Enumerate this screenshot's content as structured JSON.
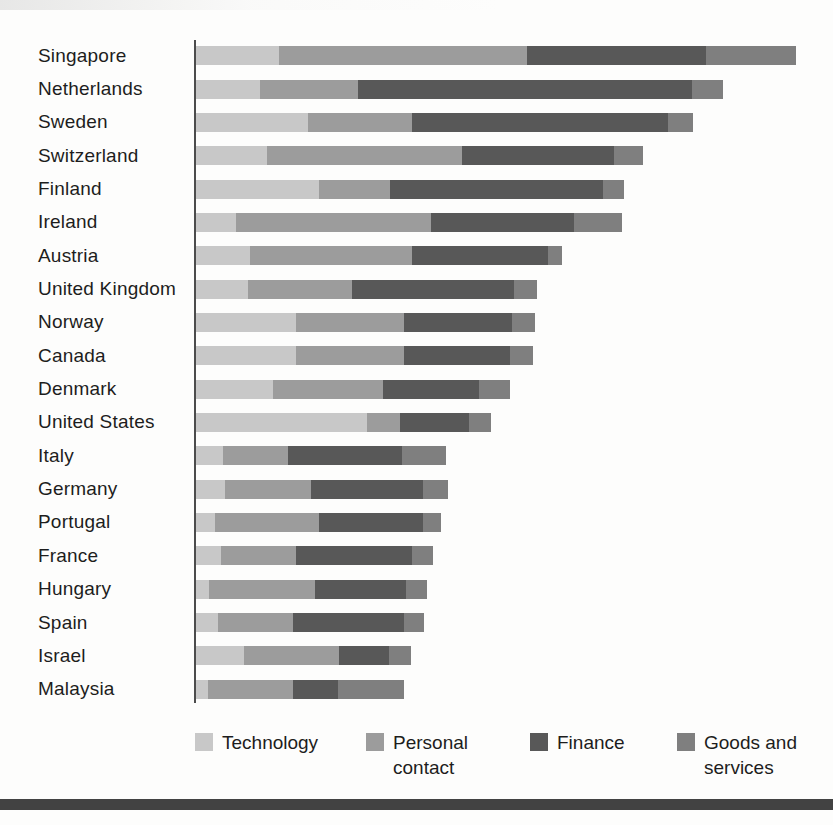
{
  "chart_data": {
    "type": "bar",
    "orientation": "horizontal",
    "stacked": true,
    "title": "",
    "xlabel": "",
    "ylabel": "",
    "axis_note": "no visible axis scale, ticks or gridlines; segment sizes estimated in pixels from the rendered bars",
    "units": "pixels (bar segment widths, no numeric axis shown)",
    "legend_position": "bottom",
    "categories": [
      "Singapore",
      "Netherlands",
      "Sweden",
      "Switzerland",
      "Finland",
      "Ireland",
      "Austria",
      "United Kingdom",
      "Norway",
      "Canada",
      "Denmark",
      "United States",
      "Italy",
      "Germany",
      "Portugal",
      "France",
      "Hungary",
      "Spain",
      "Israel",
      "Malaysia"
    ],
    "series": [
      {
        "name": "Technology",
        "color": "#c8c8c8",
        "values_px": [
          83,
          64,
          112,
          71,
          123,
          40,
          54,
          52,
          100,
          100,
          77,
          171,
          27,
          29,
          19,
          25,
          13,
          22,
          48,
          12
        ]
      },
      {
        "name": "Personal contact",
        "color": "#9c9c9c",
        "values_px": [
          248,
          98,
          104,
          195,
          71,
          195,
          162,
          104,
          108,
          108,
          110,
          33,
          65,
          86,
          104,
          75,
          106,
          75,
          95,
          85
        ]
      },
      {
        "name": "Finance",
        "color": "#585858",
        "values_px": [
          179,
          334,
          256,
          152,
          213,
          143,
          136,
          162,
          108,
          106,
          96,
          69,
          114,
          112,
          104,
          116,
          91,
          111,
          50,
          45
        ]
      },
      {
        "name": "Goods and services",
        "color": "#7f7f7f",
        "values_px": [
          90,
          31,
          25,
          29,
          21,
          48,
          14,
          23,
          23,
          23,
          31,
          22,
          44,
          25,
          18,
          21,
          21,
          20,
          22,
          66
        ]
      }
    ]
  },
  "legend": {
    "items": [
      {
        "label": "Technology",
        "color": "#c8c8c8",
        "x": 195
      },
      {
        "label": "Personal\ncontact",
        "color": "#9c9c9c",
        "x": 366
      },
      {
        "label": "Finance",
        "color": "#585858",
        "x": 530
      },
      {
        "label": "Goods and\nservices",
        "color": "#7f7f7f",
        "x": 677
      }
    ]
  },
  "decorations": {
    "bottom_rule_color": "#424242",
    "axis_line_color": "#4c4c4c",
    "text_color": "#1d1d1d",
    "background_color": "#fdfdfc"
  }
}
